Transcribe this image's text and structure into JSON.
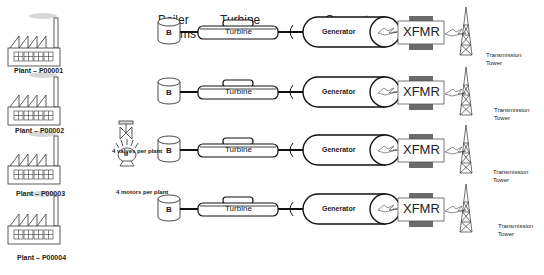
{
  "headers": {
    "boiler": [
      "Boiler",
      "Rooms"
    ],
    "turbine": [
      "Turbine",
      "Rooms"
    ],
    "generator": [
      "Generator",
      "Rooms"
    ]
  },
  "plants": [
    {
      "id": "Plant – P00001"
    },
    {
      "id": "Plant – P00002"
    },
    {
      "id": "Plant – P00003"
    },
    {
      "id": "Plant – P00004"
    }
  ],
  "equipment_notes": {
    "valves": "4 valves per plant",
    "motors": "4 motors per plant",
    "motor_symbol": "M"
  },
  "rows": [
    {
      "boiler": "B",
      "turbine": "Turbine",
      "generator": "Generator",
      "xfmr": "XFMR",
      "tower": [
        "Transmission",
        "Tower"
      ]
    },
    {
      "boiler": "B",
      "turbine": "Turbine",
      "generator": "Generator",
      "xfmr": "XFMR",
      "tower": [
        "Transmission",
        "Tower"
      ]
    },
    {
      "boiler": "B",
      "turbine": "Turbine",
      "generator": "Generator",
      "xfmr": "XFMR",
      "tower": [
        "Transmission",
        "Tower"
      ]
    },
    {
      "boiler": "B",
      "turbine": "Turbine",
      "generator": "Generator",
      "xfmr": "XFMR",
      "tower": [
        "Transmission",
        "Tower"
      ]
    }
  ],
  "colors": {
    "stroke": "#111111",
    "xfmr_core": "#6b6b6b",
    "smoke": "#d8d8d8"
  }
}
